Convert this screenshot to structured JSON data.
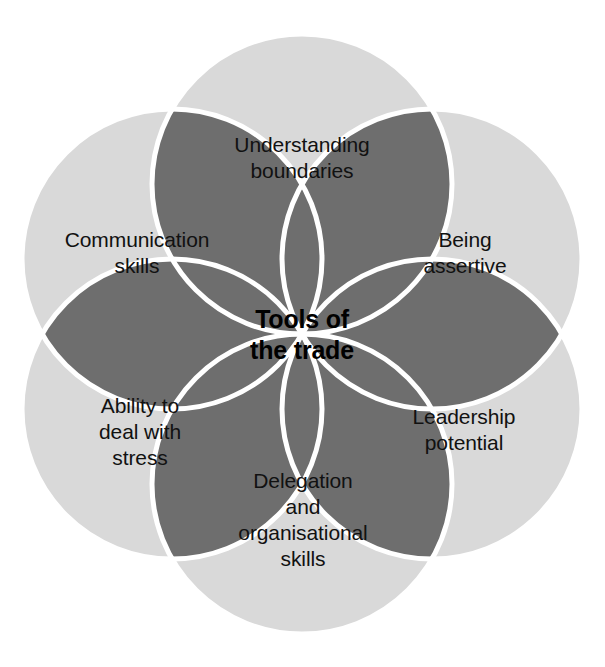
{
  "diagram": {
    "type": "venn-flower",
    "title": "Tools of the trade",
    "center": {
      "label": "Tools of\nthe trade",
      "x": 302,
      "y": 334
    },
    "colors": {
      "background": "#ffffff",
      "circle_fill": "#d9d9d9",
      "overlap_fill": "#6e6e6e",
      "outline": "#ffffff",
      "text": "#111111",
      "center_text": "#000000"
    },
    "geometry": {
      "center_x": 302,
      "center_y": 334,
      "orbit_radius": 150,
      "circle_radius": 150,
      "petal_count": 6,
      "stroke_width": 5
    },
    "petals": [
      {
        "id": "understanding-boundaries",
        "label": "Understanding\nboundaries",
        "angle_deg": 270,
        "label_x": 302,
        "label_y": 158,
        "cx": 302,
        "cy": 184
      },
      {
        "id": "being-assertive",
        "label": "Being\nassertive",
        "angle_deg": 330,
        "label_x": 465,
        "label_y": 253,
        "cx": 432,
        "cy": 259
      },
      {
        "id": "leadership-potential",
        "label": "Leadership\npotential",
        "angle_deg": 30,
        "label_x": 464,
        "label_y": 430,
        "cx": 432,
        "cy": 409
      },
      {
        "id": "delegation-and-organisational-skills",
        "label": "Delegation\nand\norganisational\nskills",
        "angle_deg": 90,
        "label_x": 303,
        "label_y": 520,
        "cx": 302,
        "cy": 484
      },
      {
        "id": "ability-to-deal-with-stress",
        "label": "Ability to\ndeal with\nstress",
        "angle_deg": 150,
        "label_x": 140,
        "label_y": 432,
        "cx": 172,
        "cy": 409
      },
      {
        "id": "communication-skills",
        "label": "Communication\nskills",
        "angle_deg": 210,
        "label_x": 137,
        "label_y": 253,
        "cx": 172,
        "cy": 259
      }
    ]
  }
}
